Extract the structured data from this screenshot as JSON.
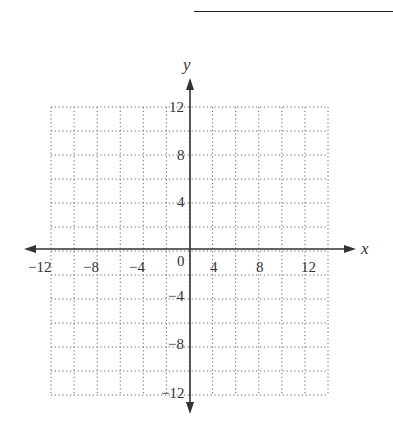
{
  "answer_blank": "",
  "chart_data": {
    "type": "scatter",
    "title": "",
    "xlabel": "x",
    "ylabel": "y",
    "xlim": [
      -12,
      12
    ],
    "ylim": [
      -12,
      12
    ],
    "grid": true,
    "grid_step": 2,
    "grid_style": "dotted",
    "x_ticks": [
      -12,
      -8,
      -4,
      0,
      4,
      8,
      12
    ],
    "y_ticks": [
      -12,
      -8,
      -4,
      4,
      8,
      12
    ],
    "x_tick_labels": [
      "−12",
      "−8",
      "−4",
      "0",
      "4",
      "8",
      "12"
    ],
    "y_tick_labels": [
      "−12",
      "−8",
      "−4",
      "4",
      "8",
      "12"
    ],
    "series": [],
    "legend": null
  },
  "labels": {
    "x": "x",
    "y": "y",
    "origin": "0",
    "xt": [
      "−12",
      "−8",
      "−4",
      "4",
      "8",
      "12"
    ],
    "yt": [
      "12",
      "8",
      "4",
      "−4",
      "−8",
      "−12"
    ]
  }
}
